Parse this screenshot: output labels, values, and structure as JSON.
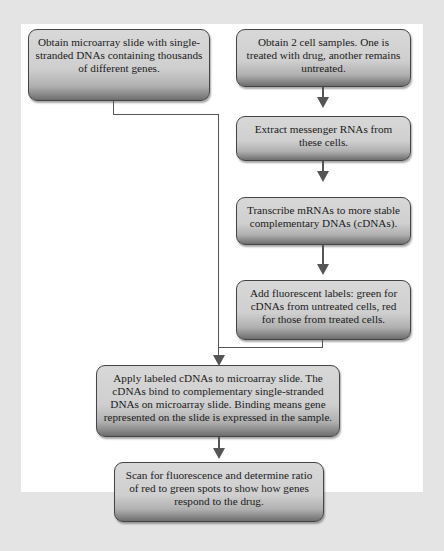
{
  "diagram": {
    "type": "flowchart",
    "colors": {
      "background": "#e4e4e4",
      "panel": "#ffffff",
      "box_fill": "#d0d0d0",
      "connector": "#555555"
    },
    "steps": [
      {
        "id": "microarray",
        "text": "Obtain microarray slide with single-stranded DNAs containing thousands of different genes."
      },
      {
        "id": "samples",
        "text": "Obtain 2 cell samples. One is treated with drug, another remains untreated."
      },
      {
        "id": "extract",
        "text": "Extract messenger RNAs from these cells."
      },
      {
        "id": "transcribe",
        "text": "Transcribe mRNAs to more stable complementary DNAs (cDNAs)."
      },
      {
        "id": "label",
        "text": "Add fluorescent labels: green for cDNAs from untreated cells, red for those from treated cells."
      },
      {
        "id": "apply",
        "text": "Apply labeled  cDNAs to microarray slide. The cDNAs bind to complementary single-stranded DNAs on microarray slide. Binding means gene represented on the slide is expressed in the sample."
      },
      {
        "id": "scan",
        "text": "Scan for fluorescence and determine ratio of red to green spots to show how genes respond to the drug."
      }
    ],
    "edges": [
      {
        "from": "samples",
        "to": "extract"
      },
      {
        "from": "extract",
        "to": "transcribe"
      },
      {
        "from": "transcribe",
        "to": "label"
      },
      {
        "from": "microarray",
        "to": "apply"
      },
      {
        "from": "label",
        "to": "apply"
      },
      {
        "from": "apply",
        "to": "scan"
      }
    ]
  }
}
